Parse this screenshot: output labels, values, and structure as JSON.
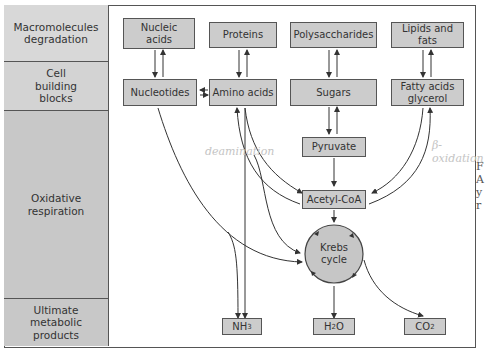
{
  "rows": [
    {
      "label": "Macromolecules degradation"
    },
    {
      "label": "Cell building blocks"
    },
    {
      "label": "Oxidative respiration"
    },
    {
      "label": "Ultimate metabolic products"
    }
  ],
  "macromolecules": {
    "nucleic_acids": "Nucleic acids",
    "proteins": "Proteins",
    "polysaccharides": "Polysaccharides",
    "lipids": "Lipids and fats"
  },
  "building_blocks": {
    "nucleotides": "Nucleotides",
    "amino_acids": "Amino acids",
    "sugars": "Sugars",
    "fatty_acids": "Fatty acids glycerol"
  },
  "respiration": {
    "pyruvate": "Pyruvate",
    "acetyl_coa": "Acetyl-CoA",
    "krebs_line1": "Krebs",
    "krebs_line2": "cycle"
  },
  "products": {
    "nh3_base": "NH",
    "nh3_sub": "3",
    "h2o_a": "H",
    "h2o_sub": "2",
    "h2o_b": "O",
    "co2_base": "CO",
    "co2_sub": "2"
  },
  "annotations": {
    "deamination": "deamination",
    "b_oxidation": "β-oxidation"
  },
  "side_text": [
    "F",
    "A",
    "y",
    "r"
  ],
  "colors": {
    "box_fill": "#cccccc",
    "label_fill": "#c8c8c8",
    "line": "#333333",
    "handwriting": "#c4c4c4"
  }
}
